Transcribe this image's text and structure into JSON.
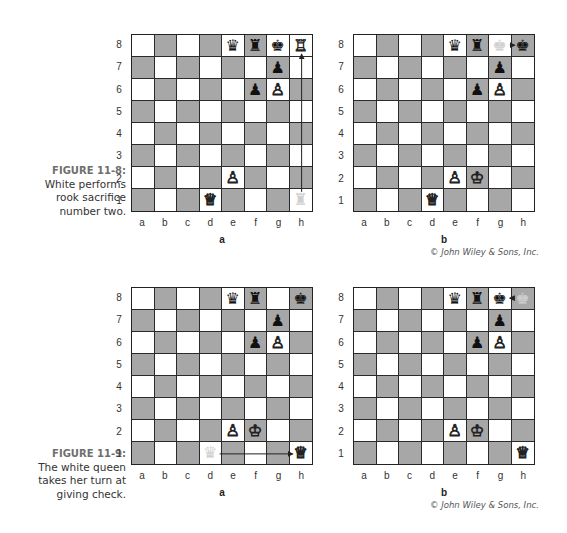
{
  "figures": [
    {
      "id": "11-8",
      "label": "FIGURE 11-8:",
      "caption_lines": [
        "White performs",
        "rook sacrifice",
        "number two."
      ],
      "copyright": "© John Wiley & Sons, Inc.",
      "boards": [
        {
          "label": "a",
          "pieces": [
            {
              "sq": "e8",
              "glyph": "♛",
              "color": "black",
              "name": "black-queen"
            },
            {
              "sq": "f8",
              "glyph": "♜",
              "color": "black",
              "name": "black-rook"
            },
            {
              "sq": "g8",
              "glyph": "♚",
              "color": "black",
              "name": "black-king"
            },
            {
              "sq": "h8",
              "glyph": "♖",
              "color": "white",
              "name": "white-rook"
            },
            {
              "sq": "g7",
              "glyph": "♟",
              "color": "black",
              "name": "black-pawn"
            },
            {
              "sq": "f6",
              "glyph": "♟",
              "color": "black",
              "name": "black-pawn"
            },
            {
              "sq": "g6",
              "glyph": "♙",
              "color": "white",
              "name": "white-pawn"
            },
            {
              "sq": "e2",
              "glyph": "♙",
              "color": "white",
              "name": "white-pawn"
            },
            {
              "sq": "d1",
              "glyph": "♕",
              "color": "white",
              "name": "white-queen"
            },
            {
              "sq": "h1",
              "glyph": "♜",
              "color": "ghost",
              "name": "ghost-rook"
            }
          ],
          "highlight": [
            "h8",
            "h1"
          ],
          "arrows": [
            {
              "from": "h1",
              "to": "h8"
            }
          ]
        },
        {
          "label": "b",
          "pieces": [
            {
              "sq": "e8",
              "glyph": "♛",
              "color": "black",
              "name": "black-queen"
            },
            {
              "sq": "f8",
              "glyph": "♜",
              "color": "black",
              "name": "black-rook"
            },
            {
              "sq": "g8",
              "glyph": "♚",
              "color": "ghost",
              "name": "ghost-king"
            },
            {
              "sq": "h8",
              "glyph": "♚",
              "color": "black",
              "name": "black-king"
            },
            {
              "sq": "g7",
              "glyph": "♟",
              "color": "black",
              "name": "black-pawn"
            },
            {
              "sq": "f6",
              "glyph": "♟",
              "color": "black",
              "name": "black-pawn"
            },
            {
              "sq": "g6",
              "glyph": "♙",
              "color": "white",
              "name": "white-pawn"
            },
            {
              "sq": "e2",
              "glyph": "♙",
              "color": "white",
              "name": "white-pawn"
            },
            {
              "sq": "f2",
              "glyph": "♔",
              "color": "white",
              "name": "white-king"
            },
            {
              "sq": "d1",
              "glyph": "♕",
              "color": "white",
              "name": "white-queen"
            }
          ],
          "highlight": [],
          "arrows": [
            {
              "from": "g8",
              "to": "h8"
            }
          ]
        }
      ]
    },
    {
      "id": "11-9",
      "label": "FIGURE 11-9:",
      "caption_lines": [
        "The white queen",
        "takes her turn at",
        "giving check."
      ],
      "copyright": "© John Wiley & Sons, Inc.",
      "boards": [
        {
          "label": "a",
          "pieces": [
            {
              "sq": "e8",
              "glyph": "♛",
              "color": "black",
              "name": "black-queen"
            },
            {
              "sq": "f8",
              "glyph": "♜",
              "color": "black",
              "name": "black-rook"
            },
            {
              "sq": "h8",
              "glyph": "♚",
              "color": "black",
              "name": "black-king"
            },
            {
              "sq": "g7",
              "glyph": "♟",
              "color": "black",
              "name": "black-pawn"
            },
            {
              "sq": "f6",
              "glyph": "♟",
              "color": "black",
              "name": "black-pawn"
            },
            {
              "sq": "g6",
              "glyph": "♙",
              "color": "white",
              "name": "white-pawn"
            },
            {
              "sq": "e2",
              "glyph": "♙",
              "color": "white",
              "name": "white-pawn"
            },
            {
              "sq": "f2",
              "glyph": "♔",
              "color": "white",
              "name": "white-king"
            },
            {
              "sq": "d1",
              "glyph": "♛",
              "color": "ghost",
              "name": "ghost-queen"
            },
            {
              "sq": "h1",
              "glyph": "♕",
              "color": "white",
              "name": "white-queen"
            }
          ],
          "highlight": [],
          "arrows": [
            {
              "from": "d1",
              "to": "h1"
            }
          ]
        },
        {
          "label": "b",
          "pieces": [
            {
              "sq": "e8",
              "glyph": "♛",
              "color": "black",
              "name": "black-queen"
            },
            {
              "sq": "f8",
              "glyph": "♜",
              "color": "black",
              "name": "black-rook"
            },
            {
              "sq": "g8",
              "glyph": "♚",
              "color": "black",
              "name": "black-king"
            },
            {
              "sq": "h8",
              "glyph": "♚",
              "color": "ghost",
              "name": "ghost-king"
            },
            {
              "sq": "g7",
              "glyph": "♟",
              "color": "black",
              "name": "black-pawn"
            },
            {
              "sq": "f6",
              "glyph": "♟",
              "color": "black",
              "name": "black-pawn"
            },
            {
              "sq": "g6",
              "glyph": "♙",
              "color": "white",
              "name": "white-pawn"
            },
            {
              "sq": "e2",
              "glyph": "♙",
              "color": "white",
              "name": "white-pawn"
            },
            {
              "sq": "f2",
              "glyph": "♔",
              "color": "white",
              "name": "white-king"
            },
            {
              "sq": "h1",
              "glyph": "♕",
              "color": "white",
              "name": "white-queen"
            }
          ],
          "highlight": [],
          "arrows": [
            {
              "from": "h8",
              "to": "g8"
            }
          ]
        }
      ]
    }
  ],
  "files": [
    "a",
    "b",
    "c",
    "d",
    "e",
    "f",
    "g",
    "h"
  ],
  "ranks": [
    "8",
    "7",
    "6",
    "5",
    "4",
    "3",
    "2",
    "1"
  ],
  "colors": {
    "dark_square": "#a7a7a7",
    "light_square": "#ffffff",
    "grid_line": "#2a2a2a"
  }
}
